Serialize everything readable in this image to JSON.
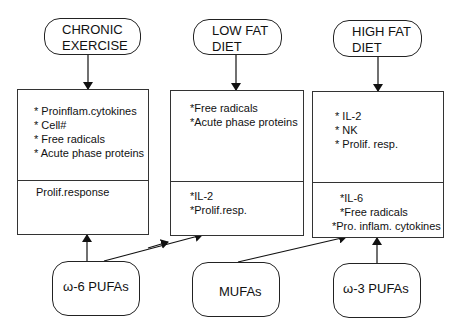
{
  "diagram": {
    "conditions": [
      {
        "id": "chronic-exercise",
        "label_line1": "CHRONIC",
        "label_line2": "EXERCISE",
        "increases": [
          "* Proinflam.cytokines",
          "* Cell#",
          "* Free radicals",
          "* Acute phase proteins"
        ],
        "decreases": [
          "Prolif.response"
        ]
      },
      {
        "id": "low-fat-diet",
        "label_line1": "LOW FAT",
        "label_line2": "DIET",
        "increases": [
          "*Free radicals",
          "*Acute phase proteins"
        ],
        "decreases": [
          "*IL-2",
          "*Prolif.resp."
        ]
      },
      {
        "id": "high-fat-diet",
        "label_line1": "HIGH FAT",
        "label_line2": "DIET",
        "increases": [
          "* IL-2",
          "* NK",
          "* Prolif. resp."
        ],
        "decreases": [
          "*IL-6",
          "*Free radicals",
          "*Pro. inflam. cytokines"
        ]
      }
    ],
    "fatty_acids": [
      {
        "id": "omega-6",
        "label": "ω-6 PUFAs",
        "targets": [
          "chronic-exercise",
          "low-fat-diet"
        ]
      },
      {
        "id": "mufa",
        "label": "MUFAs",
        "targets": [
          "low-fat-diet",
          "high-fat-diet"
        ]
      },
      {
        "id": "omega-3",
        "label": "ω-3 PUFAs",
        "targets": [
          "high-fat-diet"
        ]
      }
    ],
    "edges": [
      {
        "from": "chronic-exercise-oval",
        "to": "chronic-exercise-box"
      },
      {
        "from": "low-fat-diet-oval",
        "to": "low-fat-diet-box"
      },
      {
        "from": "high-fat-diet-oval",
        "to": "high-fat-diet-box"
      },
      {
        "from": "omega-6",
        "to": "chronic-exercise-box"
      },
      {
        "from": "omega-6",
        "to": "low-fat-diet-box"
      },
      {
        "from": "mufa",
        "to": "low-fat-diet-box"
      },
      {
        "from": "mufa",
        "to": "high-fat-diet-box"
      },
      {
        "from": "omega-3",
        "to": "high-fat-diet-box"
      }
    ],
    "colors": {
      "stroke": "#222222",
      "background": "#ffffff",
      "text": "#111111"
    }
  }
}
